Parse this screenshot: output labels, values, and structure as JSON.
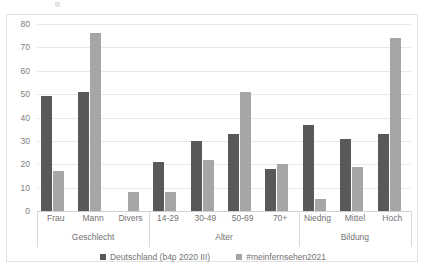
{
  "top_remnant": {
    "text": "(abgeschnitten)"
  },
  "chart_data": {
    "type": "bar",
    "title": "",
    "subtitle": "",
    "xlabel": "",
    "ylabel": "",
    "ylim": [
      0,
      80
    ],
    "yticks": [
      0,
      10,
      20,
      30,
      40,
      50,
      60,
      70,
      80
    ],
    "grid": true,
    "legend_position": "bottom",
    "categories": [
      "Frau",
      "Mann",
      "Divers",
      "14-29",
      "30-49",
      "50-69",
      "70+",
      "Niedrig",
      "Mittel",
      "Hoch"
    ],
    "category_groups": [
      {
        "label": "Geschlecht",
        "categories": [
          "Frau",
          "Mann",
          "Divers"
        ]
      },
      {
        "label": "Alter",
        "categories": [
          "14-29",
          "30-49",
          "50-69",
          "70+"
        ]
      },
      {
        "label": "Bildung",
        "categories": [
          "Niedrig",
          "Mittel",
          "Hoch"
        ]
      }
    ],
    "series": [
      {
        "name": "Deutschland (b4p 2020 III)",
        "color": "#595959",
        "values": [
          49,
          51,
          0,
          21,
          30,
          33,
          18,
          37,
          31,
          33
        ]
      },
      {
        "name": "#meinfernsehen2021",
        "color": "#a6a6a6",
        "values": [
          17,
          76,
          8,
          8,
          22,
          51,
          20,
          5,
          19,
          74
        ]
      }
    ]
  }
}
